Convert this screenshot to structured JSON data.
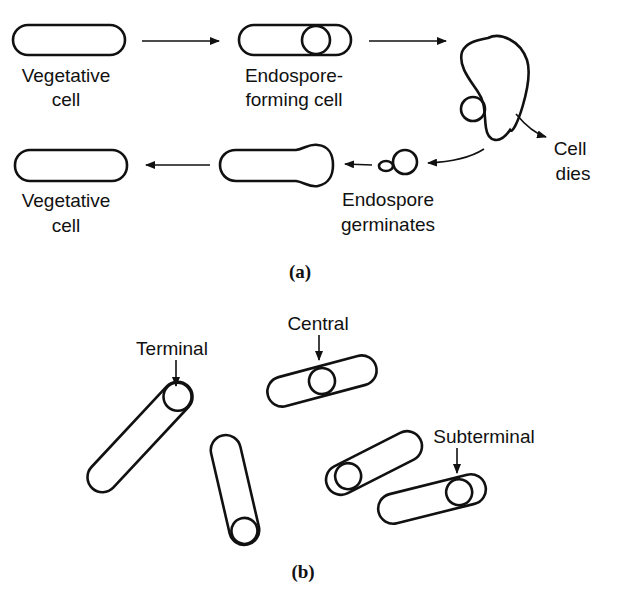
{
  "panel_a": {
    "caption": "(a)",
    "stages": [
      {
        "line1": "Vegetative",
        "line2": "cell"
      },
      {
        "line1": "Endospore-",
        "line2": "forming cell"
      },
      {
        "line1": "Cell",
        "line2": "dies"
      },
      {
        "line1": "Endospore",
        "line2": "germinates"
      },
      {
        "line1": "Vegetative",
        "line2": "cell"
      }
    ]
  },
  "panel_b": {
    "caption": "(b)",
    "positions": [
      "Terminal",
      "Central",
      "Subterminal"
    ]
  },
  "colors": {
    "ink": "#111111",
    "background": "#ffffff"
  }
}
